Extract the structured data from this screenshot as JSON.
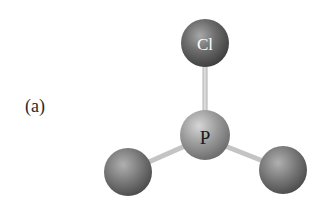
{
  "figure": {
    "panel_label": "(a)",
    "molecule": "PCl3 ball-and-stick model",
    "central_atom": {
      "symbol": "P",
      "cx": 205,
      "cy": 135,
      "r": 25,
      "color": "#9a9a9a"
    },
    "atoms": [
      {
        "id": "top",
        "symbol": "Cl",
        "cx": 205,
        "cy": 43,
        "r": 24,
        "color": "#6e6e6e",
        "show_label": true
      },
      {
        "id": "left",
        "symbol": "",
        "cx": 128,
        "cy": 172,
        "r": 24,
        "color": "#7a7a7a",
        "show_label": false
      },
      {
        "id": "right",
        "symbol": "",
        "cx": 283,
        "cy": 170,
        "r": 24,
        "color": "#7a7a7a",
        "show_label": false
      }
    ],
    "bond_color": "#c8c8c8",
    "background": "#ffffff"
  }
}
